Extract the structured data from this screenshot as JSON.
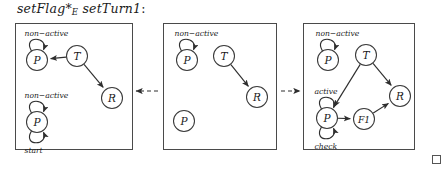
{
  "figure": {
    "title_parts": {
      "left_term": "setFlag",
      "operator": "*",
      "operator_subscript": "E",
      "right_term": "setTurn1",
      "colon": ":"
    },
    "title_text": "setFlag *E setTurn1:",
    "end_of_proof_symbol": "□",
    "colors": {
      "stroke": "#2e2e2e",
      "panel_border": "#4a4a4a",
      "node_fill": "#ffffff",
      "text": "#1a1a1a"
    }
  },
  "panels": [
    {
      "id": "panel-left",
      "name": "setFlag-graph",
      "box": {
        "x": 15,
        "y": 23,
        "w": 118,
        "h": 127
      },
      "nodes": [
        {
          "id": "p1",
          "label": "P",
          "cx": 37,
          "cy": 60,
          "r": 10.5
        },
        {
          "id": "t1",
          "label": "T",
          "cx": 77,
          "cy": 56,
          "r": 10.5
        },
        {
          "id": "r1",
          "label": "R",
          "cx": 112,
          "cy": 98,
          "r": 10.5
        },
        {
          "id": "p2",
          "label": "P",
          "cx": 37,
          "cy": 122,
          "r": 10.5
        }
      ],
      "edges": [
        {
          "from": "t1",
          "to": "p1",
          "kind": "arrow"
        },
        {
          "from": "t1",
          "to": "r1",
          "kind": "arrow"
        }
      ],
      "self_loops": [
        {
          "node": "p1",
          "label": "non−active",
          "side": "top"
        },
        {
          "node": "p2",
          "label": "non−active",
          "side": "top"
        },
        {
          "node": "p2",
          "label": "start",
          "side": "bottom"
        }
      ]
    },
    {
      "id": "panel-middle",
      "name": "intermediate-graph",
      "box": {
        "x": 163,
        "y": 23,
        "w": 114,
        "h": 127
      },
      "nodes": [
        {
          "id": "p1",
          "label": "P",
          "cx": 187,
          "cy": 60,
          "r": 10.5
        },
        {
          "id": "t1",
          "label": "T",
          "cx": 224,
          "cy": 56,
          "r": 10.5
        },
        {
          "id": "r1",
          "label": "R",
          "cx": 257,
          "cy": 97,
          "r": 10.5
        },
        {
          "id": "p2",
          "label": "P",
          "cx": 184,
          "cy": 121,
          "r": 10.5
        }
      ],
      "edges": [
        {
          "from": "t1",
          "to": "r1",
          "kind": "arrow"
        }
      ],
      "self_loops": [
        {
          "node": "p1",
          "label": "non−active",
          "side": "top"
        }
      ]
    },
    {
      "id": "panel-right",
      "name": "setTurn1-graph",
      "box": {
        "x": 303,
        "y": 23,
        "w": 112,
        "h": 127
      },
      "nodes": [
        {
          "id": "p1",
          "label": "P",
          "cx": 328,
          "cy": 60,
          "r": 10.5
        },
        {
          "id": "t1",
          "label": "T",
          "cx": 366,
          "cy": 55,
          "r": 10.5
        },
        {
          "id": "r1",
          "label": "R",
          "cx": 400,
          "cy": 96,
          "r": 10.5
        },
        {
          "id": "p2",
          "label": "P",
          "cx": 327,
          "cy": 118,
          "r": 10.5
        },
        {
          "id": "f1",
          "label": "F1",
          "cx": 364,
          "cy": 119,
          "r": 10.5
        }
      ],
      "edges": [
        {
          "from": "t1",
          "to": "p2",
          "kind": "arrow"
        },
        {
          "from": "t1",
          "to": "r1",
          "kind": "arrow"
        },
        {
          "from": "p2",
          "to": "f1",
          "kind": "arrow"
        },
        {
          "from": "f1",
          "to": "r1",
          "kind": "arrow"
        }
      ],
      "self_loops": [
        {
          "node": "p1",
          "label": "non−active",
          "side": "top"
        },
        {
          "node": "p2",
          "label": "active",
          "side": "top"
        },
        {
          "node": "p2",
          "label": "check",
          "side": "bottom"
        }
      ]
    }
  ],
  "connectors": [
    {
      "id": "conn-1",
      "name": "dashed-arrow-left",
      "from_x": 158,
      "to_x": 136,
      "y": 91,
      "direction": "left"
    },
    {
      "id": "conn-2",
      "name": "dashed-arrow-right",
      "from_x": 281,
      "to_x": 300,
      "y": 91,
      "direction": "right"
    }
  ]
}
